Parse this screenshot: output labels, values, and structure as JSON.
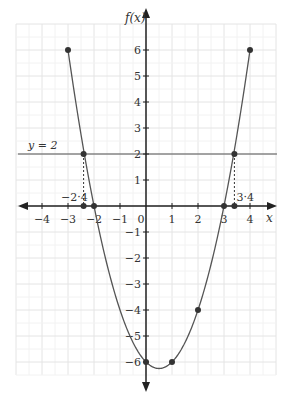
{
  "chart_data": {
    "type": "line",
    "title": "",
    "function": "f(x) = x^2 - x - 6",
    "xlabel": "x",
    "ylabel": "f(x)",
    "xlim": [
      -5,
      5
    ],
    "ylim": [
      -6.5,
      7
    ],
    "grid": true,
    "x_ticks": [
      -4,
      -3,
      -2,
      -1,
      0,
      1,
      2,
      3,
      4
    ],
    "x_tick_labels": [
      "−4",
      "−3",
      "−2",
      "−1",
      "0",
      "1",
      "2",
      "3",
      "4"
    ],
    "y_ticks": [
      6,
      5,
      4,
      3,
      2,
      1,
      -1,
      -2,
      -3,
      -4,
      -5,
      -6
    ],
    "y_tick_labels": [
      "6",
      "5",
      "4",
      "3",
      "2",
      "1",
      "−1",
      "−2",
      "−3",
      "−4",
      "−5",
      "−6"
    ],
    "series": [
      {
        "name": "f(x)",
        "curve_domain": [
          -3,
          4
        ],
        "points": [
          {
            "x": -3,
            "y": 6
          },
          {
            "x": -2,
            "y": 0
          },
          {
            "x": 0,
            "y": -6
          },
          {
            "x": 1,
            "y": -6
          },
          {
            "x": 2,
            "y": -4
          },
          {
            "x": 3,
            "y": 0
          },
          {
            "x": 4,
            "y": 6
          }
        ]
      },
      {
        "name": "y = 2",
        "type": "horizontal_line",
        "y": 2
      }
    ],
    "intersections": [
      {
        "x": -2.4,
        "y": 2,
        "label": "−2·4"
      },
      {
        "x": 3.4,
        "y": 2,
        "label": "3·4"
      }
    ],
    "annotations": [
      {
        "text": "y = 2",
        "x": -4.3,
        "y": 2.2
      }
    ]
  },
  "labels": {
    "fx": "f(x)",
    "x": "x",
    "line_label": "y = 2",
    "left_intersection": "−2·4",
    "right_intersection": "3·4",
    "origin": "0"
  },
  "colors": {
    "curve": "#555555",
    "axis": "#222222",
    "grid": "#e6e6e6",
    "point": "#333333"
  }
}
